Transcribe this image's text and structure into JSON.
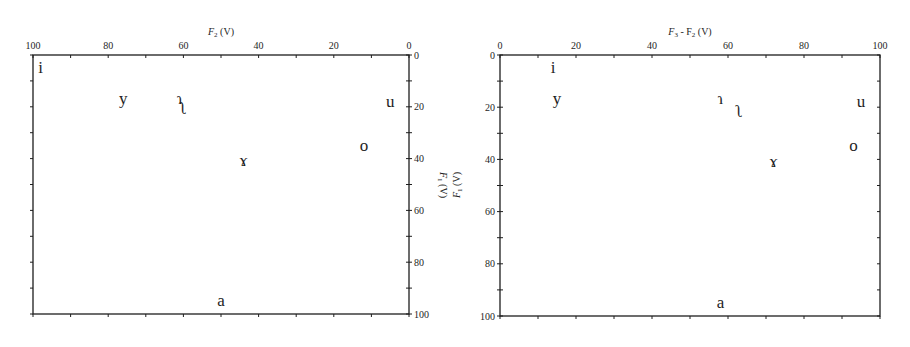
{
  "chart_data": [
    {
      "type": "scatter",
      "title": "",
      "xlabel": "F2 (V)",
      "ylabel": "F1 (V)",
      "xlim": [
        100,
        0
      ],
      "ylim": [
        100,
        0
      ],
      "x_axis_position": "top",
      "y_axis_position": "right",
      "x_ticks": [
        100,
        80,
        60,
        40,
        20,
        0
      ],
      "y_ticks": [
        0,
        20,
        40,
        60,
        80,
        100
      ],
      "grid": false,
      "points": [
        {
          "label": "i",
          "x": 98,
          "y": 5
        },
        {
          "label": "y",
          "x": 76,
          "y": 17
        },
        {
          "label": "ɿ",
          "x": 61,
          "y": 17
        },
        {
          "label": "ʅ",
          "x": 60,
          "y": 21
        },
        {
          "label": "ɤ",
          "x": 44,
          "y": 41
        },
        {
          "label": "o",
          "x": 12,
          "y": 35
        },
        {
          "label": "u",
          "x": 5,
          "y": 18
        },
        {
          "label": "a",
          "x": 50,
          "y": 95
        }
      ]
    },
    {
      "type": "scatter",
      "title": "",
      "xlabel": "F3 - F2 (V)",
      "ylabel": "F1 (V)",
      "xlim": [
        0,
        100
      ],
      "ylim": [
        100,
        0
      ],
      "x_axis_position": "top",
      "y_axis_position": "left",
      "x_ticks": [
        0,
        20,
        40,
        60,
        80,
        100
      ],
      "y_ticks": [
        0,
        20,
        40,
        60,
        80,
        100
      ],
      "grid": false,
      "points": [
        {
          "label": "i",
          "x": 14,
          "y": 5
        },
        {
          "label": "y",
          "x": 15,
          "y": 17
        },
        {
          "label": "ɿ",
          "x": 58,
          "y": 17
        },
        {
          "label": "ʅ",
          "x": 63,
          "y": 22
        },
        {
          "label": "ɤ",
          "x": 72,
          "y": 41
        },
        {
          "label": "o",
          "x": 93,
          "y": 35
        },
        {
          "label": "u",
          "x": 95,
          "y": 18
        },
        {
          "label": "a",
          "x": 58,
          "y": 95
        }
      ]
    }
  ],
  "left": {
    "xlabel_main": "F",
    "xlabel_sub": "2",
    "xlabel_unit": " (V)",
    "ylabel_main": "F",
    "ylabel_sub": "1",
    "ylabel_unit": " (V)"
  },
  "right": {
    "xlabel_main": "F",
    "xlabel_sub": "3",
    "xlabel_mid": " - F",
    "xlabel_sub2": "2",
    "xlabel_unit": " (V)",
    "ylabel_main": "F",
    "ylabel_sub": "1",
    "ylabel_unit": " (V)"
  },
  "colors": {
    "ink": "#1e1e1e",
    "background": "#ffffff"
  }
}
